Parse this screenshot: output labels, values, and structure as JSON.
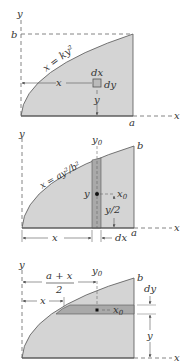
{
  "colors": {
    "fill": "#d4d4d4",
    "strip": "#a9a9a9",
    "line": "#555555",
    "dash": "#666666"
  },
  "panels": [
    {
      "id": "panel-1",
      "curve_label": "x = ky²",
      "labels": {
        "y_axis": "y",
        "x_axis": "x",
        "b": "b",
        "a": "a",
        "dx": "dx",
        "dy": "dy",
        "x": "x",
        "y": "y"
      }
    },
    {
      "id": "panel-2",
      "curve_label": "x = ay²/b²",
      "labels": {
        "y_axis": "y",
        "x_axis": "x",
        "b": "b",
        "a": "a",
        "y0": "y",
        "y0_sub": "0",
        "x0": "x",
        "x0_sub": "0",
        "y": "y",
        "y_half": "y/2",
        "x": "x",
        "dx": "dx"
      }
    },
    {
      "id": "panel-3",
      "labels": {
        "y_axis": "y",
        "x_axis": "x",
        "b": "b",
        "a_plus_x": "a + x",
        "two": "2",
        "y0": "y",
        "y0_sub": "0",
        "x": "x",
        "x0": "x",
        "x0_sub": "0",
        "dy": "dy",
        "y": "y"
      }
    }
  ]
}
